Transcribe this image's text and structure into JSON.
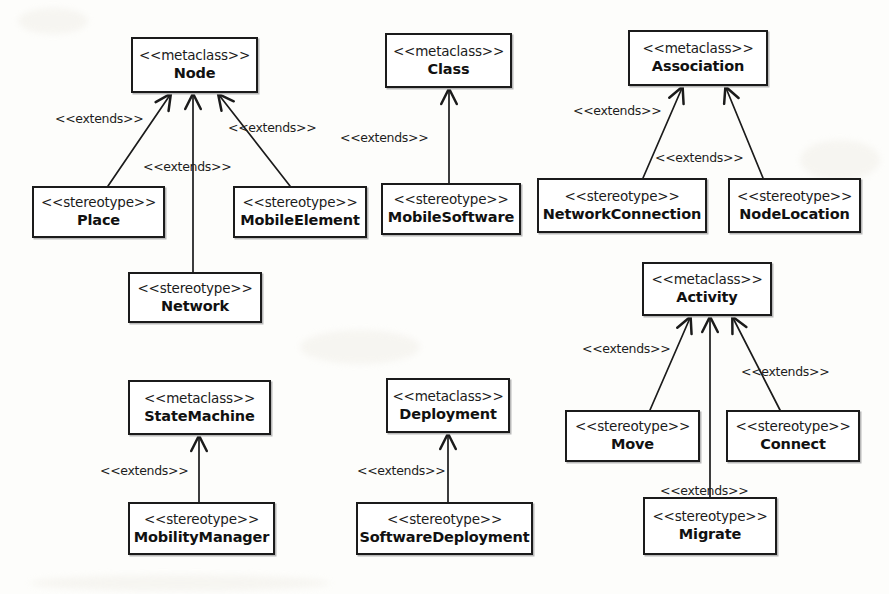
{
  "diagram": {
    "width": 889,
    "height": 594,
    "stereotype_keyword": "<<stereotype>>",
    "metaclass_keyword": "<<metaclass>>",
    "extends_keyword": "<<extends>>",
    "colors": {
      "background": "#fdfdfb",
      "box_fill": "#ffffff",
      "border": "#1b1b1b",
      "text": "#111111",
      "edge": "#1b1b1b"
    }
  },
  "nodes": [
    {
      "id": "node",
      "kind": "<<metaclass>>",
      "name": "Node",
      "x": 131,
      "y": 37,
      "w": 127,
      "h": 56
    },
    {
      "id": "place",
      "kind": "<<stereotype>>",
      "name": "Place",
      "x": 32,
      "y": 186,
      "w": 133,
      "h": 52
    },
    {
      "id": "mobileelement",
      "kind": "<<stereotype>>",
      "name": "MobileElement",
      "x": 233,
      "y": 186,
      "w": 134,
      "h": 52
    },
    {
      "id": "network",
      "kind": "<<stereotype>>",
      "name": "Network",
      "x": 128,
      "y": 272,
      "w": 134,
      "h": 51
    },
    {
      "id": "class",
      "kind": "<<metaclass>>",
      "name": "Class",
      "x": 385,
      "y": 33,
      "w": 127,
      "h": 55
    },
    {
      "id": "mobilesoftware",
      "kind": "<<stereotype>>",
      "name": "MobileSoftware",
      "x": 381,
      "y": 183,
      "w": 140,
      "h": 52
    },
    {
      "id": "association",
      "kind": "<<metaclass>>",
      "name": "Association",
      "x": 628,
      "y": 30,
      "w": 140,
      "h": 56
    },
    {
      "id": "networkconnection",
      "kind": "<<stereotype>>",
      "name": "NetworkConnection",
      "x": 537,
      "y": 178,
      "w": 170,
      "h": 55
    },
    {
      "id": "nodelocation",
      "kind": "<<stereotype>>",
      "name": "NodeLocation",
      "x": 728,
      "y": 178,
      "w": 133,
      "h": 55
    },
    {
      "id": "activity",
      "kind": "<<metaclass>>",
      "name": "Activity",
      "x": 642,
      "y": 262,
      "w": 130,
      "h": 54
    },
    {
      "id": "move",
      "kind": "<<stereotype>>",
      "name": "Move",
      "x": 565,
      "y": 410,
      "w": 135,
      "h": 52
    },
    {
      "id": "connect",
      "kind": "<<stereotype>>",
      "name": "Connect",
      "x": 726,
      "y": 410,
      "w": 134,
      "h": 52
    },
    {
      "id": "migrate",
      "kind": "<<stereotype>>",
      "name": "Migrate",
      "x": 643,
      "y": 497,
      "w": 134,
      "h": 58
    },
    {
      "id": "statemachine",
      "kind": "<<metaclass>>",
      "name": "StateMachine",
      "x": 128,
      "y": 380,
      "w": 143,
      "h": 55
    },
    {
      "id": "mobilitymanager",
      "kind": "<<stereotype>>",
      "name": "MobilityManager",
      "x": 128,
      "y": 502,
      "w": 147,
      "h": 53
    },
    {
      "id": "deployment",
      "kind": "<<metaclass>>",
      "name": "Deployment",
      "x": 386,
      "y": 378,
      "w": 124,
      "h": 55
    },
    {
      "id": "softwaredeployment",
      "kind": "<<stereotype>>",
      "name": "SoftwareDeployment",
      "x": 356,
      "y": 502,
      "w": 177,
      "h": 53
    }
  ],
  "edges": [
    {
      "id": "e1",
      "from": "place",
      "to": "node",
      "label": "<<extends>>",
      "label_x": 55,
      "label_y": 111,
      "x1": 108,
      "y1": 186,
      "x2": 170,
      "y2": 95
    },
    {
      "id": "e2",
      "from": "network",
      "to": "node",
      "label": "<<extends>>",
      "label_x": 143,
      "label_y": 159,
      "x1": 193,
      "y1": 272,
      "x2": 193,
      "y2": 95
    },
    {
      "id": "e3",
      "from": "mobileelement",
      "to": "node",
      "label": "<<extends>>",
      "label_x": 228,
      "label_y": 120,
      "x1": 290,
      "y1": 186,
      "x2": 219,
      "y2": 95
    },
    {
      "id": "e4",
      "from": "mobilesoftware",
      "to": "class",
      "label": "<<extends>>",
      "label_x": 340,
      "label_y": 130,
      "x1": 449,
      "y1": 183,
      "x2": 449,
      "y2": 90
    },
    {
      "id": "e5",
      "from": "networkconnection",
      "to": "association",
      "label": "<<extends>>",
      "label_x": 573,
      "label_y": 103,
      "x1": 643,
      "y1": 178,
      "x2": 682,
      "y2": 88
    },
    {
      "id": "e6",
      "from": "nodelocation",
      "to": "association",
      "label": "<<extends>>",
      "label_x": 655,
      "label_y": 150,
      "x1": 763,
      "y1": 178,
      "x2": 726,
      "y2": 88
    },
    {
      "id": "e7",
      "from": "move",
      "to": "activity",
      "label": "<<extends>>",
      "label_x": 582,
      "label_y": 341,
      "x1": 650,
      "y1": 410,
      "x2": 690,
      "y2": 318
    },
    {
      "id": "e8",
      "from": "connect",
      "to": "activity",
      "label": "<<extends>>",
      "label_x": 741,
      "label_y": 364,
      "x1": 780,
      "y1": 410,
      "x2": 733,
      "y2": 318
    },
    {
      "id": "e9",
      "from": "migrate",
      "to": "activity",
      "label": "<<extends>>",
      "label_x": 660,
      "label_y": 483,
      "x1": 710,
      "y1": 497,
      "x2": 710,
      "y2": 318
    },
    {
      "id": "e10",
      "from": "mobilitymanager",
      "to": "statemachine",
      "label": "<<extends>>",
      "label_x": 100,
      "label_y": 463,
      "x1": 199,
      "y1": 502,
      "x2": 199,
      "y2": 437
    },
    {
      "id": "e11",
      "from": "softwaredeployment",
      "to": "deployment",
      "label": "<<extends>>",
      "label_x": 357,
      "label_y": 463,
      "x1": 448,
      "y1": 502,
      "x2": 448,
      "y2": 435
    }
  ]
}
